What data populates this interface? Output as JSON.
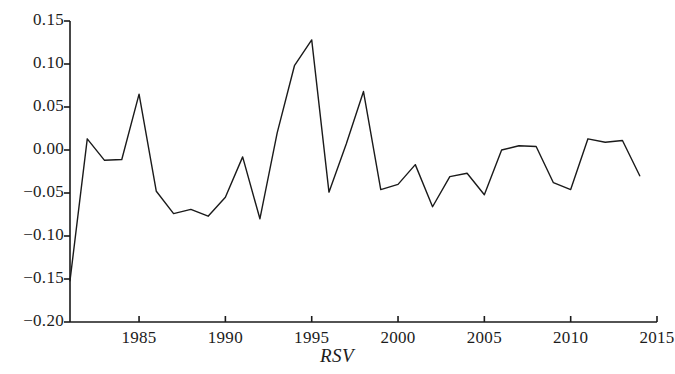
{
  "chart_data": {
    "type": "line",
    "title": "",
    "subtitle": "",
    "xlabel": "RSV",
    "ylabel": "",
    "xlim": [
      1981,
      2015
    ],
    "ylim": [
      -0.2,
      0.15
    ],
    "grid": false,
    "legend": null,
    "xticks": [
      1985,
      1990,
      1995,
      2000,
      2005,
      2010,
      2015
    ],
    "xtick_labels": [
      "1985",
      "1990",
      "1995",
      "2000",
      "2005",
      "2010",
      "2015"
    ],
    "yticks": [
      0.15,
      0.1,
      0.05,
      0.0,
      -0.05,
      -0.1,
      -0.15,
      -0.2
    ],
    "ytick_labels": [
      "0.15",
      "0.10",
      "0.05",
      "0.00",
      "−0.05",
      "−0.10",
      "−0.15",
      "−0.20"
    ],
    "line_color": "#1a1a1a",
    "line_width": 1.4,
    "x": [
      1981,
      1982,
      1983,
      1984,
      1985,
      1986,
      1987,
      1988,
      1989,
      1990,
      1991,
      1992,
      1993,
      1994,
      1995,
      1996,
      1997,
      1998,
      1999,
      2000,
      2001,
      2002,
      2003,
      2004,
      2005,
      2006,
      2007,
      2008,
      2009,
      2010,
      2011,
      2012,
      2013,
      2014
    ],
    "values": [
      -0.152,
      0.013,
      -0.012,
      -0.011,
      0.065,
      -0.048,
      -0.074,
      -0.069,
      -0.077,
      -0.055,
      -0.008,
      -0.08,
      0.02,
      0.098,
      0.128,
      -0.049,
      0.007,
      0.068,
      -0.046,
      -0.04,
      -0.017,
      -0.066,
      -0.031,
      -0.027,
      -0.052,
      0.0,
      0.005,
      0.004,
      -0.038,
      -0.046,
      0.013,
      0.009,
      0.011,
      -0.03
    ],
    "series": [
      {
        "name": "RSV",
        "values": [
          -0.152,
          0.013,
          -0.012,
          -0.011,
          0.065,
          -0.048,
          -0.074,
          -0.069,
          -0.077,
          -0.055,
          -0.008,
          -0.08,
          0.02,
          0.098,
          0.128,
          -0.049,
          0.007,
          0.068,
          -0.046,
          -0.04,
          -0.017,
          -0.066,
          -0.031,
          -0.027,
          -0.052,
          0.0,
          0.005,
          0.004,
          -0.038,
          -0.046,
          0.013,
          0.009,
          0.011,
          -0.03
        ]
      }
    ]
  }
}
